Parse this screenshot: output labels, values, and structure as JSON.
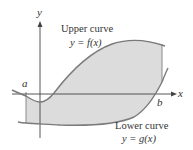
{
  "diagram": {
    "type": "area-between-curves",
    "axes": {
      "x_label": "x",
      "y_label": "y"
    },
    "bounds": {
      "left": "a",
      "right": "b"
    },
    "upper_curve": {
      "title": "Upper curve",
      "equation": "y = f(x)"
    },
    "lower_curve": {
      "title": "Lower curve",
      "equation": "y = g(x)"
    },
    "colors": {
      "region_fill": "#dcdcdc",
      "curve_stroke": "#7a7a7a",
      "axis_stroke": "#444444",
      "text": "#333333"
    }
  }
}
